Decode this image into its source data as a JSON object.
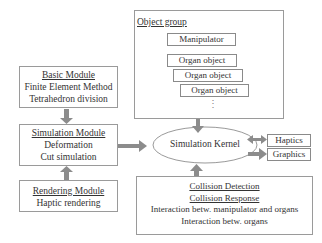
{
  "object_group": {
    "title": "Object group",
    "items": [
      "Manipulator",
      "Organ object",
      "Organ object",
      "Organ object"
    ],
    "ellipsis": "⋮"
  },
  "basic_module": {
    "title": "Basic Module",
    "lines": [
      "Finite Element Method",
      "Tetrahedron division"
    ]
  },
  "simulation_module": {
    "title": "Simulation Module",
    "lines": [
      "Deformation",
      "Cut simulation"
    ]
  },
  "rendering_module": {
    "title": "Rendering Module",
    "lines": [
      "Haptic rendering"
    ]
  },
  "kernel": {
    "label": "Simulation Kernel"
  },
  "outputs": {
    "haptics": "Haptics",
    "graphics": "Graphics"
  },
  "collision": {
    "title1": "Collision Detection",
    "title2": "Collision Response",
    "lines": [
      "Interaction betw. manipulator and organs",
      "Interaction betw. organs"
    ]
  },
  "colors": {
    "arrow": "#8c8c8c",
    "border": "#9a9a9a"
  }
}
